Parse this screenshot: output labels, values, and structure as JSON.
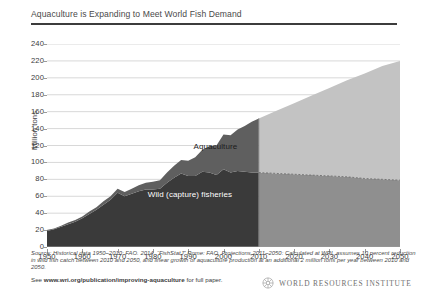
{
  "header": {
    "title": "Aquaculture is Expanding to Meet World Fish Demand"
  },
  "footer": {
    "source_note": "Source: Historical data 1950–2010: FAO. 2014. “FishStatJ” Rome: FAO, Projections 2011–2050: Calculated at WRI, assumes 10 percent reduction in wild fish catch between 2010 and 2050, and linear growth of aquaculture production at an additional 2 million tons per year between 2010 and 2050.",
    "paper_prefix": "See ",
    "paper_url": "www.wri.org/publication/improving-aquaculture",
    "paper_suffix": " for full paper.",
    "logo_text": "WORLD RESOURCES INSTITUTE",
    "logo_icon": "wri-rosette-icon"
  },
  "chart_data": {
    "type": "area",
    "stacked": true,
    "title": "Aquaculture is Expanding to Meet World Fish Demand",
    "xlabel": "",
    "ylabel": "Million tons",
    "ylim": [
      0,
      240
    ],
    "xlim": [
      1950,
      2050
    ],
    "ytick_step": 20,
    "xtick_step": 10,
    "yticks": [
      0,
      20,
      40,
      60,
      80,
      100,
      120,
      140,
      160,
      180,
      200,
      220,
      240
    ],
    "xticks": [
      1950,
      1960,
      1970,
      1980,
      1990,
      2000,
      2010,
      2020,
      2030,
      2040,
      2050
    ],
    "grid": "horizontal",
    "legend": "in-plot labels",
    "projection_start_year": 2010,
    "annotations": [
      {
        "text": "Aquaculture",
        "x": 2000,
        "y": 118,
        "color": "#1c1c1c"
      },
      {
        "text": "Wild (capture) fisheries",
        "x": 1995,
        "y": 62,
        "color": "#ffffff"
      }
    ],
    "colors": {
      "wild_historical": "#3a3a3a",
      "aquaculture_historical": "#5f5f5f",
      "wild_projection": "#8f8f8f",
      "aquaculture_projection": "#c3c3c3",
      "gridline": "#d8d8d8",
      "axis": "#9a9a9a"
    },
    "x": [
      1950,
      1952,
      1954,
      1956,
      1958,
      1960,
      1962,
      1964,
      1966,
      1968,
      1970,
      1972,
      1974,
      1976,
      1978,
      1980,
      1982,
      1984,
      1986,
      1988,
      1990,
      1992,
      1994,
      1996,
      1998,
      2000,
      2002,
      2004,
      2006,
      2008,
      2010,
      2015,
      2020,
      2025,
      2030,
      2035,
      2040,
      2045,
      2050
    ],
    "series": [
      {
        "name": "Wild (capture) fisheries",
        "values": [
          19,
          21,
          24,
          27,
          30,
          34,
          39,
          44,
          50,
          56,
          64,
          60,
          63,
          66,
          68,
          68,
          69,
          76,
          82,
          87,
          84,
          84,
          89,
          88,
          85,
          92,
          88,
          90,
          89,
          88,
          88,
          87,
          86,
          85,
          84,
          83,
          81,
          80,
          79
        ]
      },
      {
        "name": "Aquaculture",
        "values": [
          1,
          1,
          1,
          2,
          2,
          2,
          3,
          3,
          4,
          4,
          5,
          5,
          6,
          7,
          8,
          9,
          10,
          12,
          14,
          16,
          18,
          22,
          26,
          31,
          35,
          41,
          44,
          49,
          54,
          60,
          64,
          74,
          84,
          94,
          104,
          114,
          124,
          134,
          141
        ]
      }
    ],
    "totals_note": {
      "1950": 20,
      "2010": 152,
      "2050": 220
    }
  }
}
